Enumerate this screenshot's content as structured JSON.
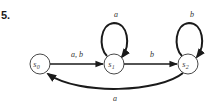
{
  "problem": {
    "number": "5."
  },
  "states": [
    {
      "id": "s0",
      "name": "s",
      "sub": "0"
    },
    {
      "id": "s1",
      "name": "s",
      "sub": "1"
    },
    {
      "id": "s2",
      "name": "s",
      "sub": "2"
    }
  ],
  "transitions": [
    {
      "from": "s0",
      "to": "s1",
      "label": "a, b"
    },
    {
      "from": "s1",
      "to": "s1",
      "label": "a"
    },
    {
      "from": "s1",
      "to": "s2",
      "label": "b"
    },
    {
      "from": "s2",
      "to": "s2",
      "label": "b"
    },
    {
      "from": "s2",
      "to": "s0",
      "label": "a"
    }
  ]
}
